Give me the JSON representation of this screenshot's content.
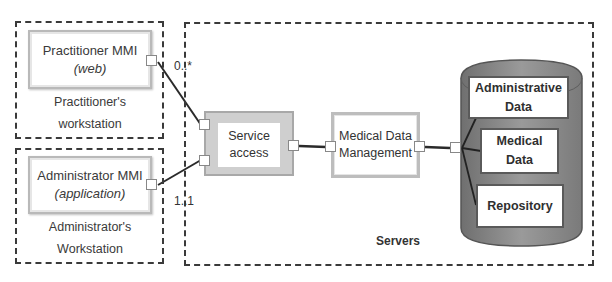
{
  "practitioner_workstation": {
    "caption_line1": "Practitioner's",
    "caption_line2": "workstation",
    "component": {
      "title": "Practitioner MMI",
      "subtitle": "(web)"
    }
  },
  "administrator_workstation": {
    "caption_line1": "Administrator's",
    "caption_line2": "Workstation",
    "component": {
      "title": "Administrator MMI",
      "subtitle": "(application)"
    }
  },
  "servers": {
    "label": "Servers",
    "service_access": {
      "line1": "Service",
      "line2": "access"
    },
    "medical_data_management": {
      "line1": "Medical Data",
      "line2": "Management"
    },
    "database": {
      "items": [
        {
          "line1": "Administrative",
          "line2": "Data"
        },
        {
          "line1": "Medical",
          "line2": "Data"
        },
        {
          "line1": "Repository",
          "line2": ""
        }
      ],
      "fill_color": "#8a8a8a"
    }
  },
  "multiplicities": {
    "practitioner": "0..*",
    "administrator": "1..1"
  }
}
